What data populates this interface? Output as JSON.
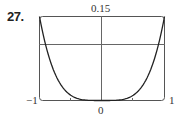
{
  "problem_number": "27.",
  "chart_data": {
    "type": "line",
    "title": "",
    "xlabel": "",
    "ylabel": "",
    "xlim": [
      -1,
      1
    ],
    "ylim": [
      0,
      0.15
    ],
    "x_tick_labels": {
      "left": "-1",
      "center": "0",
      "right": "1"
    },
    "y_tick_labels": {
      "top": "0.15"
    },
    "x_ticks": [
      -1,
      -0.5,
      0,
      0.5,
      1
    ],
    "horizontal_reference_line": 0.1,
    "grid": false,
    "series": [
      {
        "name": "curve",
        "x": [
          -1,
          -0.9,
          -0.8,
          -0.6,
          -0.4,
          -0.2,
          0,
          0.2,
          0.4,
          0.6,
          0.8,
          0.9,
          1
        ],
        "values": [
          0.15,
          0.098,
          0.061,
          0.019,
          0.004,
          0.0002,
          0,
          0.0002,
          0.004,
          0.019,
          0.061,
          0.098,
          0.15
        ]
      }
    ]
  },
  "labels": {
    "top": "0.15",
    "left": "−1",
    "right": "1",
    "bottom": "0"
  },
  "colors": {
    "axis": "#555555",
    "curve": "#222222"
  }
}
